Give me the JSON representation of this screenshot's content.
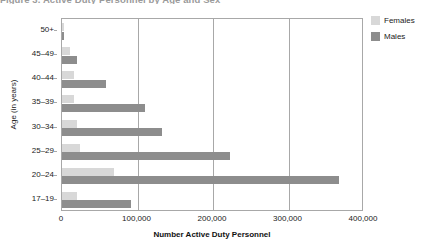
{
  "chart_data": {
    "type": "bar",
    "orientation": "horizontal",
    "title": "Figure 3. Active Duty Personnel by Age and Sex",
    "xlabel": "Number Active Duty Personnel",
    "ylabel": "Age (in years)",
    "categories": [
      "17–19",
      "20–24",
      "25–29",
      "30–34",
      "35–39",
      "40–44",
      "45–49",
      "50+"
    ],
    "series": [
      {
        "name": "Females",
        "color": "#d8d8d8",
        "values": [
          20000,
          69000,
          24000,
          20000,
          16000,
          16000,
          11000,
          2000
        ]
      },
      {
        "name": "Males",
        "color": "#8d8d8d",
        "values": [
          92000,
          367000,
          222000,
          132000,
          110000,
          58000,
          20000,
          3000
        ]
      }
    ],
    "xlim": [
      0,
      400000
    ],
    "xticks": [
      0,
      100000,
      200000,
      300000,
      400000
    ],
    "xtick_labels": [
      "0",
      "100,000",
      "200,000",
      "300,000",
      "400,000"
    ],
    "grid": "vertical",
    "legend_position": "top-right",
    "legend_entries": [
      "Females",
      "Males"
    ]
  }
}
